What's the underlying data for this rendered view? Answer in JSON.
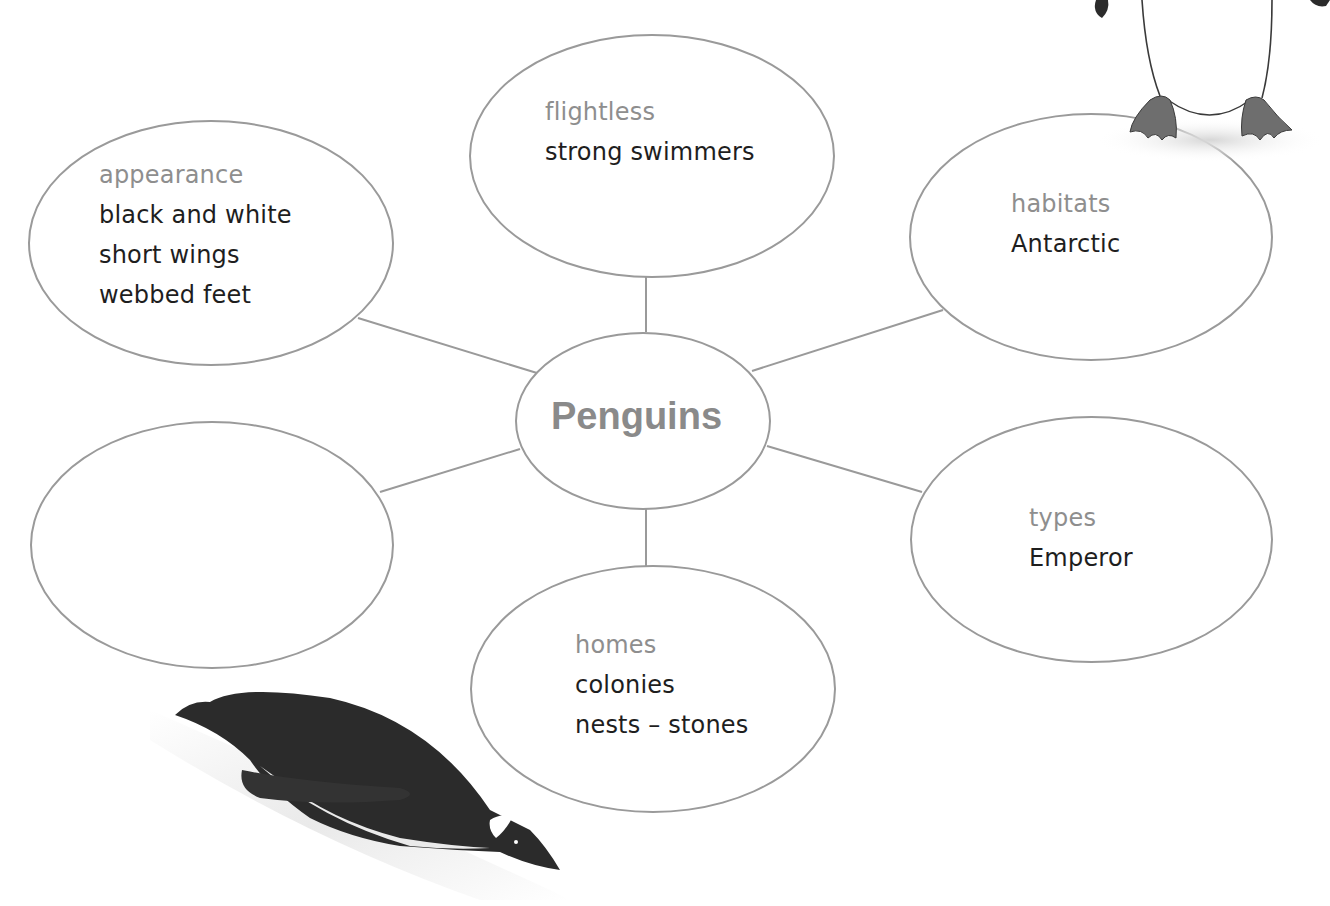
{
  "diagram": {
    "type": "mind-map",
    "center": {
      "title": "Penguins"
    },
    "nodes": [
      {
        "id": "flightless",
        "label": "flightless",
        "items": [
          "strong swimmers"
        ]
      },
      {
        "id": "appearance",
        "label": "appearance",
        "items": [
          "black and white",
          "short wings",
          "webbed feet"
        ]
      },
      {
        "id": "habitats",
        "label": "habitats",
        "items": [
          "Antarctic"
        ]
      },
      {
        "id": "empty",
        "label": "",
        "items": []
      },
      {
        "id": "types",
        "label": "types",
        "items": [
          "Emperor"
        ]
      },
      {
        "id": "homes",
        "label": "homes",
        "items": [
          "colonies",
          "nests – stones"
        ]
      }
    ],
    "illustrations": [
      "standing-penguin-feet",
      "sliding-penguin"
    ]
  },
  "colors": {
    "outline": "#9a9a9a",
    "label": "#8e8e8e",
    "text": "#1e1e1e",
    "center_text": "#8a8a8a",
    "penguin_dark": "#2b2b2b"
  }
}
